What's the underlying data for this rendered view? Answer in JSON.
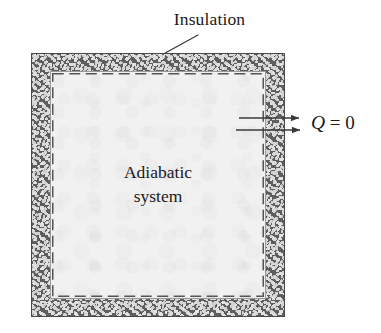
{
  "figure": {
    "width": 381,
    "height": 333,
    "background_color": "#ffffff"
  },
  "labels": {
    "insulation": "Insulation",
    "system_line_1": "Adiabatic",
    "system_line_2": "system"
  },
  "annotation": {
    "q_symbol": "Q",
    "q_equals": " = ",
    "q_value": "0",
    "q_full": "Q = 0"
  },
  "arrows": [
    {
      "name": "heat-arrow-inward",
      "direction": "left",
      "y": 118,
      "x_start": 298,
      "x_end": 238
    },
    {
      "name": "heat-arrow-outward",
      "direction": "right",
      "y": 130,
      "x_start": 235,
      "x_end": 300
    }
  ],
  "geometry": {
    "insulation_box": {
      "x": 31,
      "y": 53,
      "width": 254,
      "height": 264
    },
    "wall_thickness": 19,
    "interior": {
      "x": 50,
      "y": 71,
      "width": 216,
      "height": 228
    },
    "dashed_boundary": {
      "x": 52,
      "y": 73,
      "width": 212,
      "height": 224
    }
  },
  "colors": {
    "insulation_matrix": "#5e5e5e",
    "insulation_pebble": "#d8d8d8",
    "interior_fill": "#f1f1f1",
    "line_color": "#3a3a3a",
    "text_color": "#1a1a1a",
    "dashed_boundary": "#555555"
  }
}
